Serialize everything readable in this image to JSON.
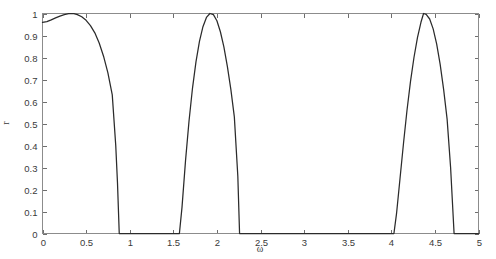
{
  "figure": {
    "title": "",
    "background_color": "#ffffff"
  },
  "axis_labels": {
    "x": "ω",
    "y": "r"
  },
  "chart_data": {
    "type": "line",
    "title": "",
    "subtitle": "",
    "xlabel": "ω",
    "ylabel": "r",
    "xlim": [
      0,
      5
    ],
    "ylim": [
      0,
      1
    ],
    "grid": false,
    "legend": false,
    "legend_position": "none",
    "xticks": [
      0,
      0.5,
      1,
      1.5,
      2,
      2.5,
      3,
      3.5,
      4,
      4.5,
      5
    ],
    "xticklabels": [
      "0",
      "0.5",
      "1",
      "1.5",
      "2",
      "2.5",
      "3",
      "3.5",
      "4",
      "4.5",
      "5"
    ],
    "yticks": [
      0,
      0.1,
      0.2,
      0.3,
      0.4,
      0.5,
      0.6,
      0.7,
      0.8,
      0.9,
      1
    ],
    "yticklabels": [
      "0",
      "0.1",
      "0.2",
      "0.3",
      "0.4",
      "0.5",
      "0.6",
      "0.7",
      "0.8",
      "0.9",
      "1"
    ],
    "line_color": "#2b2b2b",
    "line_width": 1.25,
    "annotations": [],
    "series": [
      {
        "name": "r",
        "x": [
          0.0,
          0.05,
          0.1,
          0.15,
          0.2,
          0.25,
          0.3,
          0.33,
          0.36,
          0.4,
          0.45,
          0.5,
          0.55,
          0.6,
          0.65,
          0.7,
          0.75,
          0.8,
          0.84,
          0.86,
          0.88,
          0.92,
          1.0,
          1.1,
          1.2,
          1.3,
          1.4,
          1.5,
          1.55,
          1.57,
          1.6,
          1.64,
          1.68,
          1.72,
          1.76,
          1.8,
          1.84,
          1.88,
          1.92,
          1.96,
          2.0,
          2.04,
          2.08,
          2.12,
          2.16,
          2.2,
          2.24,
          2.26,
          2.3,
          2.4,
          2.6,
          2.8,
          3.0,
          3.2,
          3.4,
          3.6,
          3.8,
          3.95,
          4.01,
          4.03,
          4.06,
          4.1,
          4.14,
          4.18,
          4.22,
          4.26,
          4.3,
          4.34,
          4.37,
          4.4,
          4.44,
          4.48,
          4.52,
          4.56,
          4.6,
          4.64,
          4.68,
          4.7,
          4.72,
          4.76,
          4.85,
          5.0
        ],
        "y": [
          0.96,
          0.963,
          0.971,
          0.98,
          0.988,
          0.995,
          0.999,
          1.0,
          0.999,
          0.995,
          0.985,
          0.969,
          0.945,
          0.912,
          0.866,
          0.806,
          0.73,
          0.63,
          0.4,
          0.23,
          0.0,
          0.0,
          0.0,
          0.0,
          0.0,
          0.0,
          0.0,
          0.0,
          0.0,
          0.0,
          0.12,
          0.33,
          0.51,
          0.66,
          0.78,
          0.873,
          0.94,
          0.982,
          1.0,
          0.995,
          0.967,
          0.917,
          0.848,
          0.76,
          0.655,
          0.53,
          0.26,
          0.0,
          0.0,
          0.0,
          0.0,
          0.0,
          0.0,
          0.0,
          0.0,
          0.0,
          0.0,
          0.0,
          0.0,
          0.0,
          0.09,
          0.25,
          0.41,
          0.56,
          0.69,
          0.8,
          0.89,
          0.96,
          1.0,
          0.996,
          0.975,
          0.93,
          0.862,
          0.77,
          0.655,
          0.52,
          0.3,
          0.15,
          0.0,
          0.0,
          0.0,
          0.0
        ]
      }
    ]
  }
}
